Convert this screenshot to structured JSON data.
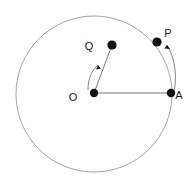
{
  "figure": {
    "type": "geometry-diagram",
    "canvas": {
      "width": 191,
      "height": 183,
      "background": "#ffffff"
    },
    "colors": {
      "circle_stroke": "#999999",
      "line_stroke": "#777777",
      "arrow_stroke": "#777777",
      "point_fill": "#111111",
      "label_fill": "#1a1a1a"
    },
    "circle": {
      "cx": 94,
      "cy": 94,
      "r": 78,
      "stroke_width": 0.9
    },
    "points": [
      {
        "id": "O",
        "label": "O",
        "cx": 94,
        "cy": 93,
        "r": 4.2,
        "label_x": 73,
        "label_y": 101
      },
      {
        "id": "A",
        "label": "A",
        "cx": 171,
        "cy": 93,
        "r": 4.2,
        "label_x": 176,
        "label_y": 99
      },
      {
        "id": "P_on_circle",
        "label": "",
        "cx": 157,
        "cy": 42,
        "r": 4.6,
        "label_x": 0,
        "label_y": 0
      },
      {
        "id": "Q_on_radius",
        "label": "",
        "cx": 112,
        "cy": 45,
        "r": 4.6,
        "label_x": 0,
        "label_y": 0
      }
    ],
    "labels": [
      {
        "id": "label-O",
        "text": "O",
        "x": 73,
        "y": 101
      },
      {
        "id": "label-A",
        "text": "A",
        "x": 176,
        "y": 99
      },
      {
        "id": "label-P",
        "text": "P",
        "x": 164,
        "y": 38
      },
      {
        "id": "label-Q",
        "text": "Q",
        "x": 85,
        "y": 50
      }
    ],
    "segments": [
      {
        "id": "radius-OA",
        "x1": 94,
        "y1": 93,
        "x2": 171,
        "y2": 93,
        "stroke_width": 1.0
      },
      {
        "id": "radius-OQ",
        "x1": 94,
        "y1": 93,
        "x2": 112,
        "y2": 45,
        "stroke_width": 1.0
      }
    ],
    "arc_arrows": [
      {
        "id": "arrow-A-to-P",
        "path": "M 173 96 C 178 78 175 58 167 45",
        "stroke_width": 0.9,
        "head": {
          "x": 167,
          "y": 45,
          "size": 2.4
        }
      },
      {
        "id": "arrow-O-to-Q",
        "path": "M 88 90 C 88 78 92 70 98 65",
        "stroke_width": 0.9,
        "head": {
          "x": 98,
          "y": 65,
          "size": 2.4
        }
      }
    ]
  }
}
